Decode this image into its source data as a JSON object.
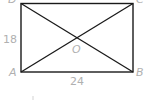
{
  "diagram": {
    "type": "rectangle-with-diagonals",
    "vertices": {
      "A": "A",
      "B": "B",
      "C": "C",
      "D": "D"
    },
    "center": "O",
    "side_lengths": {
      "AD": "18",
      "AB": "24"
    },
    "colors": {
      "stroke": "#1a1a1a",
      "label": "#b0b0b0"
    }
  }
}
